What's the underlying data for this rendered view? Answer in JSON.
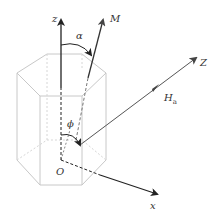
{
  "diagram": {
    "type": "hexagonal-prism-coordinate-system",
    "labels": {
      "z_axis": "z",
      "magnetization": "M",
      "alpha": "α",
      "field_axis": "Z",
      "field": "H",
      "field_sub": "a",
      "phi": "ϕ",
      "origin": "O",
      "x_axis": "x"
    },
    "colors": {
      "axis": "#222222",
      "field_line": "#555555",
      "prism_edge": "#c8c8c8",
      "prism_hidden": "#d6d6d6"
    }
  }
}
